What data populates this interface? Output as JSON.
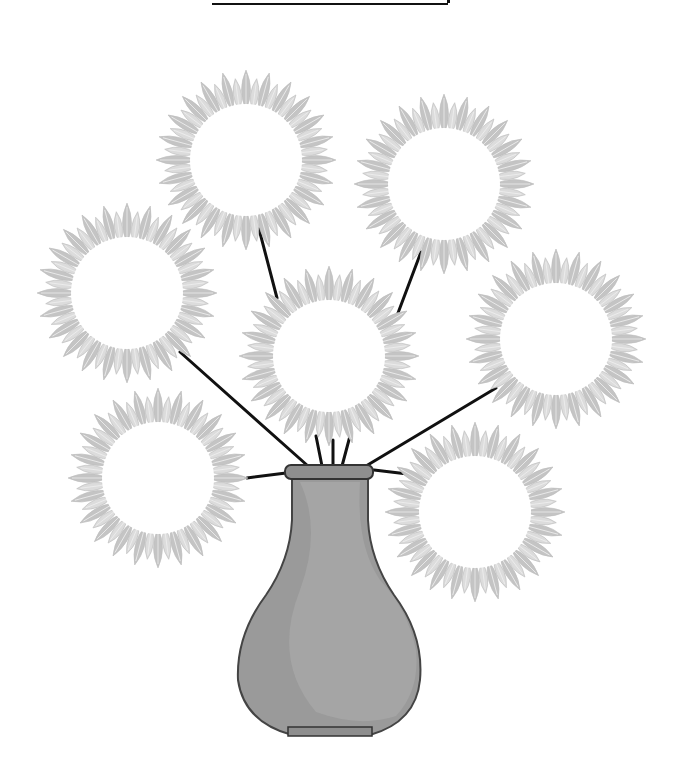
{
  "worksheet": {
    "title_blank": "",
    "colors": {
      "petal": "#dcdcdc",
      "petal_edge": "#c4c4c4",
      "center": "#ffffff",
      "stem": "#111111",
      "vase": "#9a9a9a",
      "vase_highlight": "#a9a9a9",
      "vase_outline": "#444444"
    },
    "flowers": [
      {
        "id": "top-left",
        "cx": 246,
        "cy": 160,
        "r": 56
      },
      {
        "id": "top-right",
        "cx": 444,
        "cy": 184,
        "r": 56
      },
      {
        "id": "middle-left",
        "cx": 127,
        "cy": 293,
        "r": 56
      },
      {
        "id": "center",
        "cx": 329,
        "cy": 356,
        "r": 56
      },
      {
        "id": "middle-right",
        "cx": 556,
        "cy": 339,
        "r": 56
      },
      {
        "id": "bottom-left",
        "cx": 158,
        "cy": 478,
        "r": 56
      },
      {
        "id": "bottom-right",
        "cx": 475,
        "cy": 512,
        "r": 56
      }
    ]
  }
}
